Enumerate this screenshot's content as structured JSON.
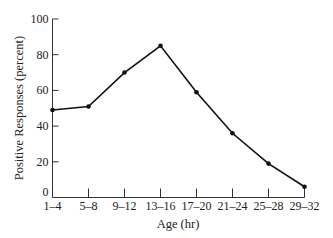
{
  "chart_data": {
    "type": "line",
    "title": "",
    "xlabel": "Age (hr)",
    "ylabel": "Positive Responses (percent)",
    "categories": [
      "1–4",
      "5–8",
      "9–12",
      "13–16",
      "17–20",
      "21–24",
      "25–28",
      "29–32"
    ],
    "series": [
      {
        "name": "Positive Responses",
        "values": [
          49,
          51,
          70,
          85,
          59,
          36,
          19,
          6
        ]
      }
    ],
    "ylim": [
      0,
      100
    ],
    "yticks": [
      0,
      20,
      40,
      60,
      80,
      100
    ],
    "grid": false,
    "legend": "none",
    "line_color": "#111111",
    "marker": "filled-circle"
  }
}
